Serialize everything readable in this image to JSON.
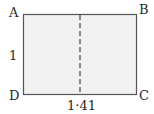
{
  "diagram": {
    "vertices": {
      "top_left": "A",
      "top_right": "B",
      "bottom_right": "C",
      "bottom_left": "D"
    },
    "side_labels": {
      "left": "1",
      "bottom": "1·41"
    },
    "colors": {
      "fill": "#f2f2f2",
      "stroke": "#555555",
      "fold_line": "#444444"
    }
  }
}
